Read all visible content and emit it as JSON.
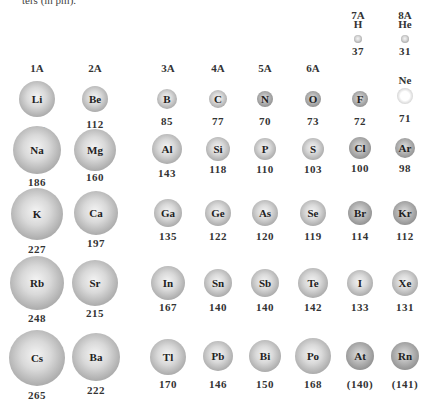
{
  "caption": "ters (in pm).",
  "groups": [
    {
      "label": "1A",
      "x": 37,
      "y": 62
    },
    {
      "label": "2A",
      "x": 95,
      "y": 62
    },
    {
      "label": "3A",
      "x": 168,
      "y": 62
    },
    {
      "label": "4A",
      "x": 218,
      "y": 62
    },
    {
      "label": "5A",
      "x": 265,
      "y": 62
    },
    {
      "label": "6A",
      "x": 313,
      "y": 62
    },
    {
      "label": "7A",
      "x": 358,
      "y": 9
    },
    {
      "label": "8A",
      "x": 405,
      "y": 9
    }
  ],
  "top": [
    {
      "symbol": "H",
      "value": "37",
      "x": 358,
      "y": 33,
      "r": 4
    },
    {
      "symbol": "He",
      "value": "31",
      "x": 405,
      "y": 33,
      "r": 4
    }
  ],
  "chart_data": {
    "type": "table",
    "columns": [
      "1A",
      "2A",
      "3A",
      "4A",
      "5A",
      "6A",
      "7A",
      "8A"
    ],
    "rows": [
      [
        "Li 152",
        "Be 112",
        "B 85",
        "C 77",
        "N 70",
        "O 73",
        "F 72",
        "Ne 71"
      ],
      [
        "Na 186",
        "Mg 160",
        "Al 143",
        "Si 118",
        "P 110",
        "S 103",
        "Cl 100",
        "Ar 98"
      ],
      [
        "K 227",
        "Ca 197",
        "Ga 135",
        "Ge 122",
        "As 120",
        "Se 119",
        "Br 114",
        "Kr 112"
      ],
      [
        "Rb 248",
        "Sr 215",
        "In 167",
        "Sn 140",
        "Sb 140",
        "Te 142",
        "I 133",
        "Xe 131"
      ],
      [
        "Cs 265",
        "Ba 222",
        "Tl 170",
        "Pb 146",
        "Bi 150",
        "Po 168",
        "At (140)",
        "Rn (141)"
      ]
    ],
    "extra": [
      "H 37",
      "He 31"
    ]
  },
  "atoms": [
    {
      "symbol": "Li",
      "value": "152",
      "x": 37,
      "y": 99,
      "r": 18,
      "vy": 124
    },
    {
      "symbol": "Be",
      "value": "112",
      "x": 95,
      "y": 99,
      "r": 13,
      "vy": 118
    },
    {
      "symbol": "B",
      "value": "85",
      "x": 167,
      "y": 99,
      "r": 10,
      "vy": 115
    },
    {
      "symbol": "C",
      "value": "77",
      "x": 218,
      "y": 99,
      "r": 9,
      "vy": 115
    },
    {
      "symbol": "N",
      "value": "70",
      "x": 265,
      "y": 99,
      "r": 8,
      "vy": 115
    },
    {
      "symbol": "O",
      "value": "73",
      "x": 313,
      "y": 99,
      "r": 8,
      "vy": 115
    },
    {
      "symbol": "F",
      "value": "72",
      "x": 360,
      "y": 99,
      "r": 8,
      "vy": 115
    },
    {
      "symbol": "Ne",
      "value": "71",
      "x": 405,
      "y": 96,
      "r": 8,
      "vy": 112,
      "label_above": true
    },
    {
      "symbol": "Na",
      "value": "186",
      "x": 37,
      "y": 150,
      "r": 24,
      "vy": 176
    },
    {
      "symbol": "Mg",
      "value": "160",
      "x": 95,
      "y": 150,
      "r": 21,
      "vy": 171
    },
    {
      "symbol": "Al",
      "value": "143",
      "x": 167,
      "y": 149,
      "r": 15,
      "vy": 167
    },
    {
      "symbol": "Si",
      "value": "118",
      "x": 218,
      "y": 149,
      "r": 12,
      "vy": 163
    },
    {
      "symbol": "P",
      "value": "110",
      "x": 265,
      "y": 149,
      "r": 11,
      "vy": 163
    },
    {
      "symbol": "S",
      "value": "103",
      "x": 313,
      "y": 149,
      "r": 11,
      "vy": 163
    },
    {
      "symbol": "Cl",
      "value": "100",
      "x": 360,
      "y": 148,
      "r": 11,
      "vy": 162
    },
    {
      "symbol": "Ar",
      "value": "98",
      "x": 405,
      "y": 148,
      "r": 10,
      "vy": 162
    },
    {
      "symbol": "K",
      "value": "227",
      "x": 37,
      "y": 214,
      "r": 26,
      "vy": 243
    },
    {
      "symbol": "Ca",
      "value": "197",
      "x": 96,
      "y": 213,
      "r": 22,
      "vy": 237
    },
    {
      "symbol": "Ga",
      "value": "135",
      "x": 168,
      "y": 213,
      "r": 14,
      "vy": 230
    },
    {
      "symbol": "Ge",
      "value": "122",
      "x": 218,
      "y": 213,
      "r": 13,
      "vy": 230
    },
    {
      "symbol": "As",
      "value": "120",
      "x": 265,
      "y": 213,
      "r": 13,
      "vy": 230
    },
    {
      "symbol": "Se",
      "value": "119",
      "x": 313,
      "y": 213,
      "r": 13,
      "vy": 230
    },
    {
      "symbol": "Br",
      "value": "114",
      "x": 360,
      "y": 213,
      "r": 12,
      "vy": 230
    },
    {
      "symbol": "Kr",
      "value": "112",
      "x": 405,
      "y": 213,
      "r": 12,
      "vy": 230
    },
    {
      "symbol": "Rb",
      "value": "248",
      "x": 37,
      "y": 283,
      "r": 27,
      "vy": 312
    },
    {
      "symbol": "Sr",
      "value": "215",
      "x": 95,
      "y": 283,
      "r": 23,
      "vy": 307
    },
    {
      "symbol": "In",
      "value": "167",
      "x": 168,
      "y": 283,
      "r": 17,
      "vy": 301
    },
    {
      "symbol": "Sn",
      "value": "140",
      "x": 218,
      "y": 283,
      "r": 14,
      "vy": 301
    },
    {
      "symbol": "Sb",
      "value": "140",
      "x": 265,
      "y": 283,
      "r": 14,
      "vy": 301
    },
    {
      "symbol": "Te",
      "value": "142",
      "x": 313,
      "y": 283,
      "r": 15,
      "vy": 301
    },
    {
      "symbol": "I",
      "value": "133",
      "x": 360,
      "y": 283,
      "r": 13,
      "vy": 301
    },
    {
      "symbol": "Xe",
      "value": "131",
      "x": 405,
      "y": 283,
      "r": 13,
      "vy": 301
    },
    {
      "symbol": "Cs",
      "value": "265",
      "x": 37,
      "y": 358,
      "r": 28,
      "vy": 389
    },
    {
      "symbol": "Ba",
      "value": "222",
      "x": 96,
      "y": 357,
      "r": 24,
      "vy": 384
    },
    {
      "symbol": "Tl",
      "value": "170",
      "x": 168,
      "y": 357,
      "r": 18,
      "vy": 378
    },
    {
      "symbol": "Pb",
      "value": "146",
      "x": 218,
      "y": 356,
      "r": 15,
      "vy": 378
    },
    {
      "symbol": "Bi",
      "value": "150",
      "x": 265,
      "y": 356,
      "r": 16,
      "vy": 378
    },
    {
      "symbol": "Po",
      "value": "168",
      "x": 313,
      "y": 356,
      "r": 18,
      "vy": 378
    },
    {
      "symbol": "At",
      "value": "(140)",
      "x": 360,
      "y": 356,
      "r": 14,
      "vy": 378
    },
    {
      "symbol": "Rn",
      "value": "(141)",
      "x": 405,
      "y": 356,
      "r": 14,
      "vy": 378
    }
  ]
}
